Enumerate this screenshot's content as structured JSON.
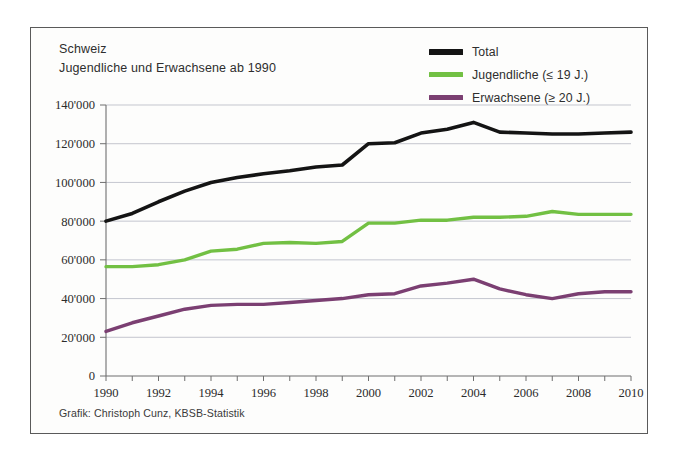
{
  "figure": {
    "title_line1": "Schweiz",
    "title_line2": "Jugendliche und Erwachsene ab 1990",
    "credit": "Grafik: Christoph Cunz, KBSB-Statistik",
    "background": "#fdfdfc",
    "frame_color": "#5a5a5a",
    "grid_color": "#b9bcc6"
  },
  "legend": {
    "position": "top-right",
    "entries": [
      {
        "label": "Total",
        "color": "#141414"
      },
      {
        "label": "Jugendliche (≤ 19 J.)",
        "color": "#72c043"
      },
      {
        "label": "Erwachsene (≥ 20 J.)",
        "color": "#7b3f72"
      }
    ]
  },
  "chart_data": {
    "type": "line",
    "xlabel": "",
    "ylabel": "",
    "grid": true,
    "xlim": [
      1990,
      2010
    ],
    "ylim": [
      0,
      140000
    ],
    "ytick_step": 20000,
    "xtick_step": 1,
    "xlabel_step": 2,
    "x": [
      1990,
      1991,
      1992,
      1993,
      1994,
      1995,
      1996,
      1997,
      1998,
      1999,
      2000,
      2001,
      2002,
      2003,
      2004,
      2005,
      2006,
      2007,
      2008,
      2009,
      2010
    ],
    "xtick_labels": [
      "1990",
      "",
      "1992",
      "",
      "1994",
      "",
      "1996",
      "",
      "1998",
      "",
      "2000",
      "",
      "2002",
      "",
      "2004",
      "",
      "2006",
      "",
      "2008",
      "",
      "2010"
    ],
    "ytick_labels": [
      "0",
      "20'000",
      "40'000",
      "60'000",
      "80'000",
      "100'000",
      "120'000",
      "140'000"
    ],
    "ytick_values": [
      0,
      20000,
      40000,
      60000,
      80000,
      100000,
      120000,
      140000
    ],
    "series": [
      {
        "name": "Total",
        "color": "#141414",
        "width": 3.6,
        "values": [
          80000,
          84000,
          90000,
          95500,
          100000,
          102500,
          104500,
          106000,
          108000,
          109000,
          120000,
          120500,
          125500,
          127500,
          131000,
          126000,
          125500,
          125000,
          125000,
          125500,
          126000
        ]
      },
      {
        "name": "Jugendliche (≤ 19 J.)",
        "color": "#72c043",
        "width": 3.4,
        "values": [
          56500,
          56500,
          57500,
          60000,
          64500,
          65500,
          68500,
          69000,
          68500,
          69500,
          79000,
          79000,
          80500,
          80500,
          82000,
          82000,
          82500,
          85000,
          83500,
          83500,
          83500
        ]
      },
      {
        "name": "Erwachsene (≥ 20 J.)",
        "color": "#7b3f72",
        "width": 3.4,
        "values": [
          23000,
          27500,
          31000,
          34500,
          36500,
          37000,
          37000,
          38000,
          39000,
          40000,
          42000,
          42500,
          46500,
          48000,
          50000,
          45000,
          42000,
          40000,
          42500,
          43500,
          43500
        ]
      }
    ]
  }
}
